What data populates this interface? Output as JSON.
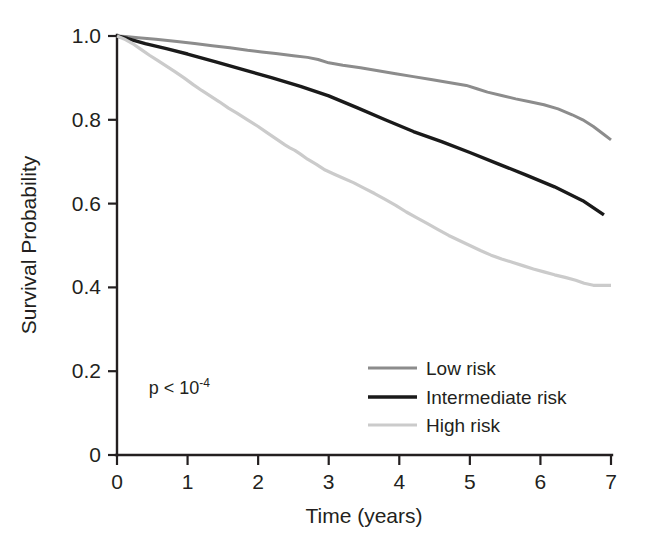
{
  "chart_data": {
    "type": "line",
    "title": "",
    "subtitle": "",
    "xlabel": "Time (years)",
    "ylabel": "Survival Probability",
    "xlim": [
      0,
      7
    ],
    "ylim": [
      0,
      1.0
    ],
    "grid": false,
    "legend_position": "inside-bottom-right",
    "annotations": [
      {
        "name": "p-value",
        "text_prefix": "p < 10",
        "text_superscript": "-4",
        "x": 0.45,
        "y": 0.145
      }
    ],
    "xticks": [
      0,
      1,
      2,
      3,
      4,
      5,
      6,
      7
    ],
    "xtick_labels": [
      "0",
      "1",
      "2",
      "3",
      "4",
      "5",
      "6",
      "7"
    ],
    "yticks": [
      0,
      0.2,
      0.4,
      0.6,
      0.8,
      1.0
    ],
    "ytick_labels": [
      "0",
      "0.2",
      "0.4",
      "0.6",
      "0.8",
      "1.0"
    ],
    "series": [
      {
        "name": "Low risk",
        "color": "#8c8c8c",
        "width": 3.0,
        "x": [
          0.0,
          0.12,
          0.3,
          0.55,
          0.85,
          1.1,
          1.35,
          1.6,
          1.85,
          2.05,
          2.25,
          2.5,
          2.7,
          2.85,
          3.0,
          3.2,
          3.45,
          3.7,
          3.95,
          4.2,
          4.45,
          4.7,
          4.95,
          5.1,
          5.25,
          5.45,
          5.65,
          5.85,
          6.05,
          6.25,
          6.45,
          6.6,
          6.75,
          6.9,
          7.0
        ],
        "y": [
          1.0,
          0.999,
          0.996,
          0.992,
          0.987,
          0.982,
          0.977,
          0.972,
          0.966,
          0.962,
          0.958,
          0.953,
          0.949,
          0.944,
          0.936,
          0.93,
          0.924,
          0.917,
          0.91,
          0.903,
          0.896,
          0.889,
          0.882,
          0.874,
          0.866,
          0.858,
          0.85,
          0.843,
          0.836,
          0.826,
          0.812,
          0.8,
          0.784,
          0.765,
          0.752
        ]
      },
      {
        "name": "Intermediate risk",
        "color": "#1a1a1a",
        "width": 3.4,
        "x": [
          0.0,
          0.15,
          0.4,
          0.7,
          1.0,
          1.4,
          1.8,
          2.2,
          2.6,
          3.0,
          3.4,
          3.8,
          4.2,
          4.6,
          5.0,
          5.4,
          5.8,
          6.2,
          6.6,
          6.9
        ],
        "y": [
          1.0,
          0.994,
          0.982,
          0.97,
          0.957,
          0.938,
          0.919,
          0.9,
          0.88,
          0.857,
          0.829,
          0.8,
          0.772,
          0.748,
          0.722,
          0.695,
          0.668,
          0.64,
          0.607,
          0.573
        ]
      },
      {
        "name": "High risk",
        "color": "#cbcbcb",
        "width": 3.2,
        "x": [
          0.0,
          0.1,
          0.22,
          0.34,
          0.46,
          0.58,
          0.7,
          0.82,
          0.95,
          1.08,
          1.2,
          1.32,
          1.45,
          1.58,
          1.7,
          1.85,
          2.0,
          2.12,
          2.25,
          2.38,
          2.45,
          2.52,
          2.6,
          2.7,
          2.82,
          2.95,
          3.08,
          3.2,
          3.35,
          3.5,
          3.65,
          3.8,
          3.95,
          4.1,
          4.25,
          4.4,
          4.55,
          4.7,
          4.85,
          5.0,
          5.15,
          5.3,
          5.45,
          5.6,
          5.75,
          5.9,
          6.05,
          6.2,
          6.35,
          6.5,
          6.62,
          6.75,
          7.0
        ],
        "y": [
          1.0,
          0.993,
          0.982,
          0.968,
          0.954,
          0.941,
          0.928,
          0.915,
          0.9,
          0.884,
          0.87,
          0.857,
          0.843,
          0.828,
          0.816,
          0.8,
          0.784,
          0.77,
          0.755,
          0.74,
          0.733,
          0.727,
          0.718,
          0.706,
          0.694,
          0.68,
          0.67,
          0.661,
          0.65,
          0.637,
          0.624,
          0.61,
          0.596,
          0.58,
          0.566,
          0.552,
          0.538,
          0.524,
          0.512,
          0.5,
          0.488,
          0.477,
          0.468,
          0.46,
          0.452,
          0.444,
          0.437,
          0.43,
          0.424,
          0.417,
          0.41,
          0.405,
          0.405
        ]
      }
    ],
    "legend": [
      {
        "label": "Low risk",
        "color": "#8c8c8c",
        "width": 3.0
      },
      {
        "label": "Intermediate risk",
        "color": "#1a1a1a",
        "width": 3.6
      },
      {
        "label": "High risk",
        "color": "#cbcbcb",
        "width": 3.0
      }
    ]
  }
}
